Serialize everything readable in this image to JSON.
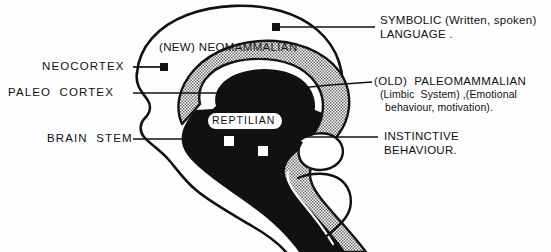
{
  "figure": {
    "title_implicit": "Triune Brain Diagram",
    "background_color": "#fdfdfd",
    "ink_color": "#111111",
    "stipple_color": "#9a9a9a"
  },
  "labels": {
    "left": [
      {
        "id": "neocortex",
        "text": "NEOCORTEX",
        "marker": "filled-square"
      },
      {
        "id": "paleo_cortex",
        "text": "PALEO  CORTEX",
        "marker": "none"
      },
      {
        "id": "brain_stem",
        "text": "BRAIN  STEM",
        "marker": "none"
      }
    ],
    "right": [
      {
        "id": "symbolic",
        "line1": "SYMBOLIC (Written, spoken)",
        "line2": "LANGUAGE ."
      },
      {
        "id": "paleomammalian",
        "line1": "(OLD)  PALEOMAMMALIAN",
        "line2": "(Limbic  System) ,(Emotional",
        "line3": "behaviour, motivation)."
      },
      {
        "id": "instinctive",
        "line1": "INSTINCTIVE",
        "line2": "BEHAVIOUR."
      }
    ],
    "inside": [
      {
        "id": "neomammalian",
        "text": "(NEW) NEOMAMMALIAN"
      },
      {
        "id": "reptilian",
        "text": "REPTILIAN"
      }
    ]
  },
  "markers": {
    "filled_squares": [
      {
        "id": "neocortex-marker",
        "x": 163,
        "y": 67
      },
      {
        "id": "symbolic-marker",
        "x": 276,
        "y": 27
      },
      {
        "id": "paleomammalian-marker",
        "x": 278,
        "y": 90
      }
    ],
    "open_squares": [
      {
        "id": "reptilian-marker-1",
        "x": 228,
        "y": 140
      },
      {
        "id": "reptilian-marker-2",
        "x": 262,
        "y": 150
      }
    ]
  },
  "leader_lines": [
    {
      "id": "leader-neocortex",
      "from": [
        133,
        67
      ],
      "to": [
        163,
        67
      ]
    },
    {
      "id": "leader-paleocortex",
      "from": [
        133,
        93
      ],
      "to": [
        295,
        93
      ]
    },
    {
      "id": "leader-brainstem",
      "from": [
        133,
        139
      ],
      "to": [
        250,
        139
      ]
    },
    {
      "id": "leader-symbolic",
      "from": [
        276,
        27
      ],
      "to": [
        375,
        27
      ]
    },
    {
      "id": "leader-paleomammalian",
      "from": [
        278,
        90
      ],
      "to": [
        372,
        82
      ]
    },
    {
      "id": "leader-instinctive",
      "from": [
        300,
        137
      ],
      "to": [
        378,
        137
      ]
    }
  ]
}
